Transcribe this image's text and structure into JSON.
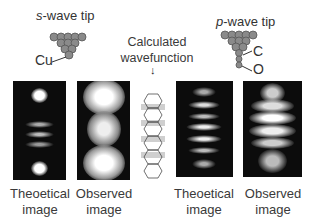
{
  "s_tip": {
    "title_italic": "s",
    "title_rest": "-wave tip",
    "atom_label": "Cu"
  },
  "p_tip": {
    "title_italic": "p",
    "title_rest": "-wave tip",
    "atom_label_1": "C",
    "atom_label_2": "O"
  },
  "center": {
    "line1": "Calculated",
    "line2": "wavefunction",
    "arrow": "↓"
  },
  "panels": [
    {
      "label_1": "Theoetical",
      "label_2": "image"
    },
    {
      "label_1": "Observed",
      "label_2": "image"
    },
    {
      "label_1": "Theoetical",
      "label_2": "image"
    },
    {
      "label_1": "Observed",
      "label_2": "image"
    }
  ]
}
